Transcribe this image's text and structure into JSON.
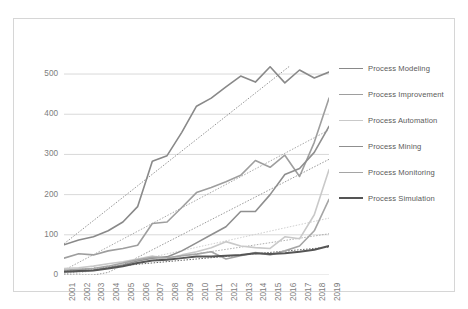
{
  "chart_data": {
    "type": "line",
    "title": "",
    "xlabel": "",
    "ylabel": "",
    "grid": true,
    "legend_position": "right",
    "ylim": [
      0,
      520
    ],
    "yticks": [
      0,
      100,
      200,
      300,
      400,
      500
    ],
    "categories": [
      "2001",
      "2002",
      "2003",
      "2004",
      "2005",
      "2006",
      "2007",
      "2008",
      "2009",
      "2010",
      "2011",
      "2012",
      "2013",
      "2014",
      "2015",
      "2016",
      "2017",
      "2018",
      "2019"
    ],
    "series": [
      {
        "name": "Process Modeling",
        "color": "#898989",
        "width": 1.6,
        "trendline": true,
        "values": [
          75,
          87,
          95,
          110,
          132,
          170,
          283,
          297,
          355,
          420,
          440,
          468,
          495,
          480,
          518,
          478,
          510,
          490,
          505
        ]
      },
      {
        "name": "Process Improvement",
        "color": "#9e9e9e",
        "width": 1.6,
        "trendline": true,
        "values": [
          42,
          53,
          50,
          60,
          66,
          74,
          128,
          132,
          168,
          205,
          218,
          232,
          248,
          285,
          268,
          298,
          245,
          330,
          440
        ]
      },
      {
        "name": "Process Automation",
        "color": "#c9c9c9",
        "width": 1.6,
        "trendline": true,
        "values": [
          16,
          18,
          22,
          28,
          33,
          40,
          47,
          40,
          50,
          58,
          68,
          83,
          72,
          68,
          66,
          95,
          90,
          150,
          262
        ]
      },
      {
        "name": "Process Mining",
        "color": "#8f8f8f",
        "width": 1.6,
        "trendline": true,
        "values": [
          8,
          9,
          12,
          18,
          25,
          35,
          42,
          45,
          60,
          80,
          100,
          120,
          158,
          158,
          200,
          250,
          265,
          305,
          370
        ]
      },
      {
        "name": "Process Monitoring",
        "color": "#a5a5a5",
        "width": 1.6,
        "trendline": true,
        "values": [
          12,
          14,
          16,
          22,
          30,
          38,
          44,
          43,
          48,
          52,
          58,
          40,
          48,
          56,
          50,
          60,
          72,
          110,
          188
        ]
      },
      {
        "name": "Process Simulation",
        "color": "#555555",
        "width": 2.0,
        "trendline": true,
        "values": [
          8,
          10,
          11,
          16,
          22,
          30,
          36,
          38,
          42,
          46,
          46,
          48,
          50,
          54,
          52,
          54,
          58,
          63,
          72
        ]
      }
    ]
  },
  "axes": {
    "y_tick_labels": [
      "500",
      "400",
      "300",
      "200",
      "100",
      "0"
    ],
    "x_tick_labels": [
      "2001",
      "2002",
      "2003",
      "2004",
      "2005",
      "2006",
      "2007",
      "2008",
      "2009",
      "2010",
      "2011",
      "2012",
      "2013",
      "2014",
      "2015",
      "2016",
      "2017",
      "2018",
      "2019"
    ]
  },
  "legend": {
    "items": [
      {
        "label": "Process Modeling"
      },
      {
        "label": "Process Improvement"
      },
      {
        "label": "Process Automation"
      },
      {
        "label": "Process Mining"
      },
      {
        "label": "Process Monitoring"
      },
      {
        "label": "Process Simulation"
      }
    ]
  }
}
